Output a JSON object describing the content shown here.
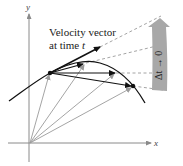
{
  "diagram": {
    "axes": {
      "x_label": "x",
      "y_label": "y"
    },
    "annotation": {
      "line1": "Velocity vector",
      "line2_prefix": "at time ",
      "line2_var": "t"
    },
    "limit_label": "Δt → 0",
    "colors": {
      "axis": "#8a8a8a",
      "curve": "#111111",
      "position_vectors": "#9a9a9a",
      "secant_vectors": "#111111",
      "dashed": "#9a9a9a",
      "band": "#a8a8a8"
    }
  }
}
